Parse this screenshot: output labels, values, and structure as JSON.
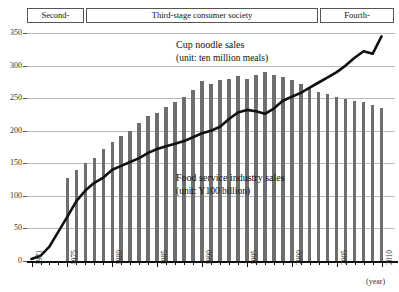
{
  "banner": {
    "stages": [
      {
        "label": "Second-",
        "name": "stage-box-second"
      },
      {
        "label": "Third-stage consumer society",
        "name": "stage-box-third"
      },
      {
        "label": "Fourth-",
        "name": "stage-box-fourth"
      }
    ]
  },
  "annotations": {
    "noodle_title": "Cup noodle sales",
    "noodle_unit": "(unit: ten million meals)",
    "food_title": "Food service industry sales",
    "food_unit": "(unit: Y100 billion)"
  },
  "axis": {
    "x_unit": "(year)",
    "y_ticks": [
      "350",
      "300",
      "250",
      "200",
      "150",
      "100",
      "50",
      "0"
    ],
    "x_labels": [
      "1971",
      "1975",
      "1980",
      "1985",
      "1990",
      "1995",
      "2000",
      "2005",
      "2010"
    ]
  },
  "colors": {
    "bar": "#6e6e6e",
    "line": "#111111",
    "grid": "#b9b9b9",
    "axis": "#111111"
  },
  "chart_data": {
    "type": "bar",
    "xlabel": "(year)",
    "ylabel": "",
    "xlim": [
      1971,
      2011
    ],
    "ylim": [
      0,
      350
    ],
    "grid": true,
    "legend": "annotations in plot",
    "x": [
      1971,
      1972,
      1973,
      1974,
      1975,
      1976,
      1977,
      1978,
      1979,
      1980,
      1981,
      1982,
      1983,
      1984,
      1985,
      1986,
      1987,
      1988,
      1989,
      1990,
      1991,
      1992,
      1993,
      1994,
      1995,
      1996,
      1997,
      1998,
      1999,
      2000,
      2001,
      2002,
      2003,
      2004,
      2005,
      2006,
      2007,
      2008,
      2009,
      2010
    ],
    "series": [
      {
        "name": "Food service industry sales",
        "type": "bar",
        "unit": "Y100 billion",
        "values": [
          null,
          null,
          null,
          null,
          128,
          140,
          150,
          158,
          172,
          182,
          192,
          200,
          212,
          222,
          228,
          236,
          244,
          252,
          262,
          276,
          272,
          278,
          280,
          284,
          280,
          286,
          290,
          286,
          282,
          278,
          272,
          266,
          260,
          256,
          252,
          248,
          246,
          244,
          240,
          235
        ]
      },
      {
        "name": "Cup noodle sales",
        "type": "line",
        "unit": "ten million meals",
        "values": [
          3,
          8,
          22,
          45,
          68,
          92,
          108,
          120,
          128,
          140,
          146,
          152,
          158,
          166,
          172,
          176,
          180,
          184,
          190,
          196,
          200,
          206,
          218,
          228,
          232,
          230,
          226,
          234,
          246,
          252,
          258,
          266,
          274,
          282,
          290,
          300,
          312,
          322,
          318,
          345
        ]
      }
    ]
  }
}
